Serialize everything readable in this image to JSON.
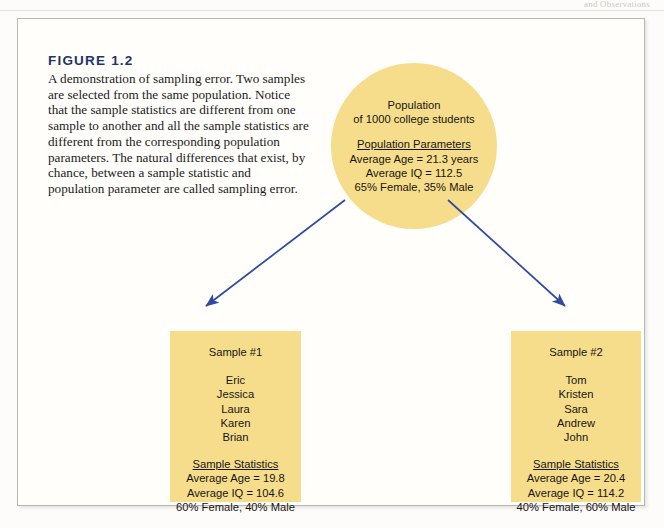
{
  "page": {
    "running_head": "and Observations"
  },
  "figure": {
    "label": "FIGURE 1.2",
    "caption": "A demonstration of sampling error. Two samples are selected from the same population. Notice that the sample statistics are different from one sample to another and all the sample statistics are different from the corresponding population parameters. The natural differences that exist, by chance, between a sample statistic and population parameter are called sampling error."
  },
  "population": {
    "title_line1": "Population",
    "title_line2": "of 1000 college students",
    "parameters_heading": "Population Parameters",
    "parameters": [
      "Average Age = 21.3 years",
      "Average IQ = 112.5",
      "65% Female, 35% Male"
    ]
  },
  "samples": [
    {
      "title": "Sample #1",
      "names": [
        "Eric",
        "Jessica",
        "Laura",
        "Karen",
        "Brian"
      ],
      "stats_heading": "Sample Statistics",
      "stats": [
        "Average Age = 19.8",
        "Average IQ = 104.6",
        "60% Female, 40% Male"
      ]
    },
    {
      "title": "Sample #2",
      "names": [
        "Tom",
        "Kristen",
        "Sara",
        "Andrew",
        "John"
      ],
      "stats_heading": "Sample Statistics",
      "stats": [
        "Average Age = 20.4",
        "Average IQ = 114.2",
        "40% Female, 60% Male"
      ]
    }
  ],
  "colors": {
    "node_fill": "#f6dd8b",
    "arrow": "#2f4a9e",
    "figure_label": "#1f3468",
    "frame_border": "#b9b6b4"
  },
  "arrows": [
    {
      "name": "arrow-population-to-sample-1",
      "from": [
        345,
        200
      ],
      "to": [
        205,
        307
      ]
    },
    {
      "name": "arrow-population-to-sample-2",
      "from": [
        448,
        200
      ],
      "to": [
        566,
        307
      ]
    }
  ]
}
